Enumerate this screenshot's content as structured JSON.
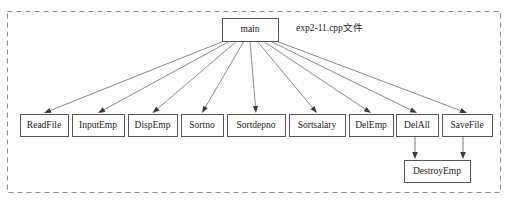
{
  "diagram": {
    "caption": "exp2-11.cpp文件",
    "caption_pos": {
      "x": 296,
      "y": 29
    },
    "container": {
      "x": 7,
      "y": 11,
      "w": 493,
      "h": 181
    },
    "root": {
      "label": "main",
      "x": 222,
      "y": 18,
      "w": 56,
      "h": 23
    },
    "children": [
      {
        "label": "ReadFile",
        "x": 20,
        "y": 114,
        "w": 48,
        "h": 22
      },
      {
        "label": "InputEmp",
        "x": 72,
        "y": 114,
        "w": 52,
        "h": 22
      },
      {
        "label": "DispEmp",
        "x": 128,
        "y": 114,
        "w": 49,
        "h": 22
      },
      {
        "label": "Sortno",
        "x": 181,
        "y": 114,
        "w": 42,
        "h": 22
      },
      {
        "label": "Sortdepno",
        "x": 227,
        "y": 114,
        "w": 58,
        "h": 22
      },
      {
        "label": "Sortsalary",
        "x": 289,
        "y": 114,
        "w": 56,
        "h": 22
      },
      {
        "label": "DelEmp",
        "x": 349,
        "y": 114,
        "w": 44,
        "h": 22
      },
      {
        "label": "DelAll",
        "x": 396,
        "y": 114,
        "w": 42,
        "h": 22
      },
      {
        "label": "SaveFile",
        "x": 442,
        "y": 114,
        "w": 50,
        "h": 22
      }
    ],
    "leaf": {
      "label": "DestroyEmp",
      "x": 404,
      "y": 160,
      "w": 66,
      "h": 22
    },
    "root_fan_x": [
      224,
      230,
      237,
      244,
      250,
      257,
      263,
      270,
      276
    ],
    "leaf_arrows_x": [
      415,
      463
    ],
    "colors": {
      "box_stroke": "#555555",
      "box_fill": "#ffffff",
      "edge": "#6e6e6e",
      "arrow": "#3a3a3a",
      "container_dash": "#8a8a8a",
      "text": "#1a1a1a",
      "background": "#fdfdfd"
    }
  }
}
